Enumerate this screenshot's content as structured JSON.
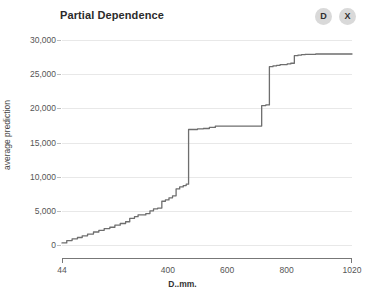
{
  "header": {
    "title": "Partial Dependence",
    "buttons": [
      {
        "name": "duplicate-button",
        "label": "D"
      },
      {
        "name": "close-button",
        "label": "X"
      }
    ]
  },
  "colors": {
    "line": "#6e6e6e",
    "grid": "#e8e8e8",
    "axis": "#777777",
    "button_bg": "#d9d9d9",
    "background": "#ffffff"
  },
  "chart_data": {
    "type": "line",
    "title": "Partial Dependence",
    "xlabel": "D..mm.",
    "ylabel": "average prediction",
    "xlim": [
      44,
      1020
    ],
    "ylim": [
      0,
      30000
    ],
    "grid": true,
    "legend": "none",
    "step_style": "post",
    "ytick_labels": [
      "0",
      "5,000",
      "10,000",
      "15,000",
      "20,000",
      "25,000",
      "30,000"
    ],
    "ytick_values": [
      0,
      5000,
      10000,
      15000,
      20000,
      25000,
      30000
    ],
    "xtick_labels": [
      "44",
      "400",
      "600",
      "800",
      "1020"
    ],
    "xtick_values": [
      44,
      400,
      600,
      800,
      1020
    ],
    "series": [
      {
        "name": "average prediction",
        "x": [
          44,
          60,
          78,
          96,
          112,
          130,
          150,
          168,
          186,
          205,
          222,
          240,
          258,
          272,
          288,
          300,
          312,
          326,
          340,
          352,
          366,
          380,
          392,
          404,
          416,
          428,
          440,
          452,
          462,
          470,
          470,
          482,
          500,
          520,
          540,
          560,
          580,
          600,
          620,
          640,
          660,
          680,
          700,
          716,
          716,
          730,
          742,
          742,
          754,
          766,
          778,
          790,
          802,
          814,
          826,
          838,
          850,
          862,
          874,
          886,
          898,
          910,
          930,
          950,
          970,
          990,
          1020
        ],
        "y": [
          300,
          650,
          900,
          1100,
          1350,
          1600,
          1900,
          2150,
          2400,
          2600,
          2900,
          3150,
          3400,
          3900,
          4150,
          4400,
          4400,
          4600,
          5000,
          5300,
          5400,
          6400,
          6600,
          6900,
          7200,
          8200,
          8500,
          8700,
          8900,
          8900,
          16900,
          16900,
          17000,
          17050,
          17200,
          17400,
          17400,
          17400,
          17400,
          17400,
          17400,
          17400,
          17400,
          17400,
          20400,
          20500,
          20500,
          26100,
          26200,
          26300,
          26400,
          26400,
          26500,
          26600,
          27700,
          27800,
          27850,
          27900,
          27900,
          27900,
          27950,
          27950,
          27950,
          27950,
          27950,
          27950,
          27950
        ]
      }
    ]
  }
}
